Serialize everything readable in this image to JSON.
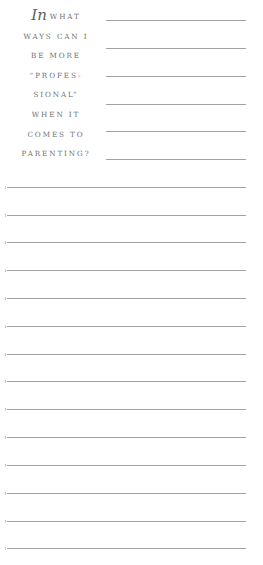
{
  "prompt": {
    "lead_word": "In",
    "lines": [
      "what",
      "ways can I",
      "be more",
      "“profes-",
      "sional”",
      "when it",
      "comes to",
      "parenting?"
    ]
  },
  "writing_area": {
    "short_rule_tops": [
      20,
      48,
      76,
      104,
      131,
      159
    ],
    "full_rule_tops": [
      187,
      215,
      242,
      270,
      298,
      326,
      354,
      381,
      409,
      437,
      465,
      493,
      521,
      548
    ],
    "text_color": "#707070",
    "rule_color": "#a3a3a3"
  }
}
